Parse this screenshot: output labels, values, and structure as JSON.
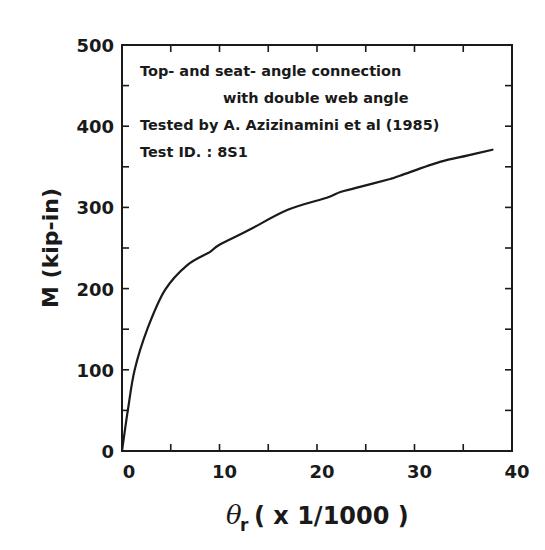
{
  "chart_data": {
    "type": "line",
    "title": "",
    "xlabel": "θr ( x 1/1000 )",
    "xlabel_parts": {
      "symbol": "θ",
      "subscript": "r",
      "rest": "( x 1/1000 )"
    },
    "ylabel": "M (kip-in)",
    "xlim": [
      0,
      40
    ],
    "ylim": [
      0,
      500
    ],
    "x_ticks": [
      0,
      10,
      20,
      30,
      40
    ],
    "x_minor_ticks": [
      5,
      15,
      25,
      35
    ],
    "y_ticks": [
      0,
      100,
      200,
      300,
      400,
      500
    ],
    "y_minor_ticks": [
      50,
      150,
      250,
      350,
      450
    ],
    "grid": false,
    "legend": null,
    "annotations": [
      "Top- and seat- angle connection",
      "with double web angle",
      "Tested by  A. Azizinamini et al (1985)",
      "Test ID. :  8S1"
    ],
    "series": [
      {
        "name": "8S1",
        "color": "#1a1a1a",
        "x": [
          0,
          0.6,
          1.3,
          2.6,
          4.4,
          6.7,
          9.0,
          10.0,
          13.0,
          17.0,
          21.0,
          22.4,
          24.0,
          27.5,
          28.5,
          32.6,
          35.5,
          38.0
        ],
        "y": [
          0,
          50,
          100,
          150,
          198,
          229,
          245,
          254,
          272,
          297,
          312,
          319,
          324,
          335,
          339,
          356,
          364,
          371
        ]
      }
    ]
  },
  "labels": {
    "y_tick_labels": [
      "0",
      "100",
      "200",
      "300",
      "400",
      "500"
    ],
    "x_tick_labels": [
      "0",
      "10",
      "20",
      "30",
      "40"
    ],
    "annotation_1": "Top- and seat- angle connection",
    "annotation_2": "with double web angle",
    "annotation_3": "Tested by  A. Azizinamini et al (1985)",
    "annotation_4": "Test ID. :  8S1",
    "ylabel": "M (kip-in)",
    "xlabel_symbol": "θ",
    "xlabel_sub": "r",
    "xlabel_rest": "( x 1/1000 )"
  }
}
